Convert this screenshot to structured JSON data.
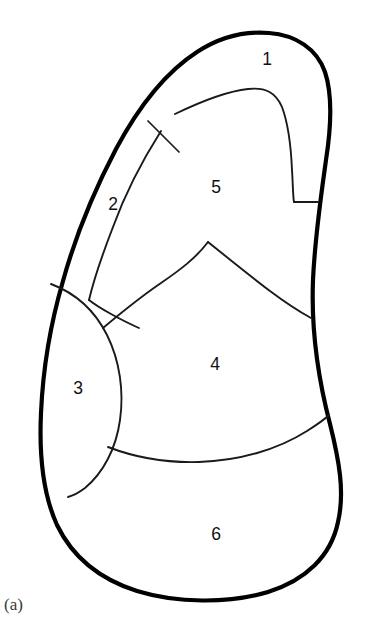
{
  "figure": {
    "caption": "(a)",
    "background_color": "#ffffff",
    "outline_color": "#000000",
    "inner_line_color": "#1a1a1a",
    "label_color": "#111111",
    "width": 365,
    "height": 622,
    "type": "line-drawing-schematic-cross-section"
  },
  "regions": [
    {
      "id": "region-1",
      "label": "1",
      "label_x": 267,
      "label_y": 60,
      "description": "narrow elongated strip along upper-right margin"
    },
    {
      "id": "region-2",
      "label": "2",
      "label_x": 113,
      "label_y": 205,
      "description": "narrow crescent band along upper-left margin"
    },
    {
      "id": "region-3",
      "label": "3",
      "label_x": 78,
      "label_y": 389,
      "description": "lens shaped zone on left margin"
    },
    {
      "id": "region-4",
      "label": "4",
      "label_x": 215,
      "label_y": 365,
      "description": "large central zone"
    },
    {
      "id": "region-5",
      "label": "5",
      "label_x": 216,
      "label_y": 188,
      "description": "upper central zone"
    },
    {
      "id": "region-6",
      "label": "6",
      "label_x": 216,
      "label_y": 535,
      "description": "lower basal zone"
    }
  ],
  "paths": {
    "outer_contour": "M 269 33 C 296 35 317 49 325 72 C 333 96 331 128 326 160 C 321 196 315 236 313 280 C 311 330 318 378 330 424 C 339 460 345 492 338 522 C 331 556 306 580 268 592 C 228 604 176 603 137 591 C 99 579 72 556 57 525 C 43 494 39 455 41 413 C 43 367 51 322 63 281 C 76 234 95 189 116 149 C 139 106 166 72 197 52 C 220 37 245 31 269 33 Z",
    "region1_inner": "M 175 114 C 202 101 229 91 248 89 C 266 87 276 93 282 107 C 288 123 291 147 292 170 C 293 186 293 197 294 202",
    "region1_cap": "M 294 202 L 318 202",
    "region2_inner": "M 161 131 C 142 161 125 194 113 227 C 101 258 93 283 89 300",
    "region2_transverse": "M 148 121 L 179 152",
    "region25_join": "M 89 300 C 94 304 102 309 111 314 C 122 320 132 325 139 328",
    "region3_lens": "M 51 284 C 75 293 95 311 107 335 C 120 361 124 392 120 420 C 116 449 103 473 85 488 C 77 494 72 496 68 497",
    "region4_upper_left": "M 103 328 C 122 312 142 296 161 283 C 180 270 196 258 208 242",
    "region4_upper_right": "M 208 242 C 228 258 250 276 270 291 C 286 303 300 312 311 318",
    "region4_lower": "M 108 447 C 134 457 166 463 199 462 C 238 461 277 450 307 431 C 318 424 325 419 329 415"
  }
}
